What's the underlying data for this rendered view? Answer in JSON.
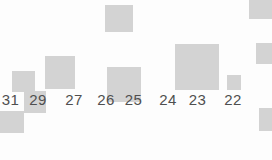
{
  "colors": {
    "background": "#fdfdfd",
    "block": "#d3d3d3",
    "label_text": "#4f4f4f"
  },
  "timeline": {
    "day_labels": [
      {
        "text": "31",
        "cx": 10.5,
        "y": 92
      },
      {
        "text": "29",
        "cx": 38,
        "y": 92
      },
      {
        "text": "27",
        "cx": 74,
        "y": 92
      },
      {
        "text": "26",
        "cx": 106,
        "y": 92
      },
      {
        "text": "25",
        "cx": 133.5,
        "y": 92
      },
      {
        "text": "24",
        "cx": 168,
        "y": 92
      },
      {
        "text": "23",
        "cx": 197.5,
        "y": 92
      },
      {
        "text": "22",
        "cx": 233,
        "y": 92
      }
    ],
    "blocks": [
      {
        "name": "block-top-center",
        "x": 105,
        "y": 5,
        "w": 28,
        "h": 27
      },
      {
        "name": "block-top-right-corner",
        "x": 249,
        "y": -8,
        "w": 27,
        "h": 27
      },
      {
        "name": "block-right-edge-upper",
        "x": 256,
        "y": 43,
        "w": 21,
        "h": 21
      },
      {
        "name": "block-day-31",
        "x": 12,
        "y": 71,
        "w": 23,
        "h": 21
      },
      {
        "name": "block-day-29",
        "x": 24,
        "y": 91,
        "w": 22,
        "h": 22
      },
      {
        "name": "block-day-27",
        "x": 45,
        "y": 56,
        "w": 30,
        "h": 33
      },
      {
        "name": "block-day-26-25",
        "x": 107,
        "y": 67,
        "w": 34,
        "h": 35
      },
      {
        "name": "block-day-23",
        "x": 175,
        "y": 44,
        "w": 44,
        "h": 46
      },
      {
        "name": "block-day-22",
        "x": 227,
        "y": 75,
        "w": 14,
        "h": 15
      },
      {
        "name": "block-bottom-left-corner",
        "x": 0,
        "y": 111,
        "w": 24,
        "h": 22
      },
      {
        "name": "block-bottom-right-edge",
        "x": 259,
        "y": 108,
        "w": 23,
        "h": 23
      }
    ]
  }
}
